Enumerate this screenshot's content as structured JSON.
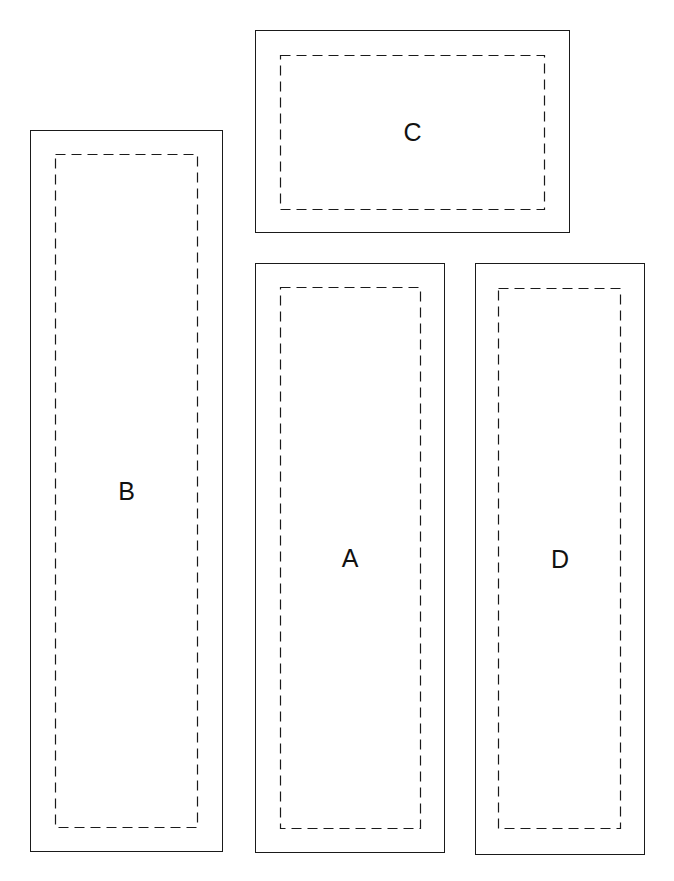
{
  "diagram": {
    "title": "",
    "colors": {
      "line": "#1a1a1a",
      "background": "#ffffff"
    },
    "panels": [
      {
        "id": "C",
        "label": "C",
        "outer": {
          "x": 255,
          "y": 30,
          "w": 315,
          "h": 203
        },
        "inner": {
          "x": 280,
          "y": 55,
          "w": 265,
          "h": 155
        }
      },
      {
        "id": "B",
        "label": "B",
        "outer": {
          "x": 30,
          "y": 130,
          "w": 193,
          "h": 722
        },
        "inner": {
          "x": 55,
          "y": 154,
          "w": 143,
          "h": 674
        }
      },
      {
        "id": "A",
        "label": "A",
        "outer": {
          "x": 255,
          "y": 263,
          "w": 190,
          "h": 590
        },
        "inner": {
          "x": 280,
          "y": 287,
          "w": 141,
          "h": 542
        }
      },
      {
        "id": "D",
        "label": "D",
        "outer": {
          "x": 475,
          "y": 263,
          "w": 170,
          "h": 592
        },
        "inner": {
          "x": 498,
          "y": 288,
          "w": 123,
          "h": 541
        }
      }
    ]
  }
}
